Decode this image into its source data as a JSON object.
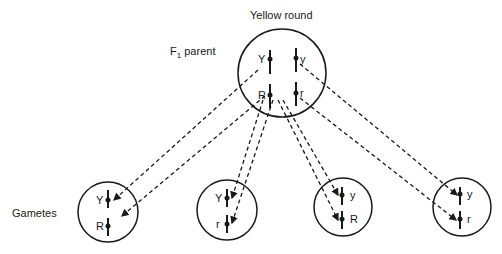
{
  "title": "Yellow round",
  "parent_label": {
    "prefix": "F",
    "subscript": "1",
    "suffix": " parent"
  },
  "gametes_label": "Gametes",
  "parent_cell": {
    "alleles": {
      "upper_left": "Y",
      "upper_right": "y",
      "lower_left": "R",
      "lower_right": "r"
    }
  },
  "gametes": [
    {
      "top": "Y",
      "bottom": "R"
    },
    {
      "top": "Y",
      "bottom": "r"
    },
    {
      "top": "y",
      "bottom": "R"
    },
    {
      "top": "y",
      "bottom": "r"
    }
  ]
}
